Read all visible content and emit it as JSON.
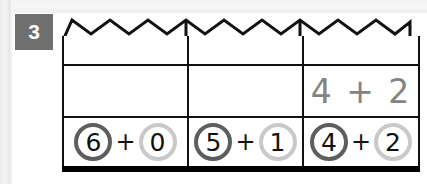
{
  "page": {
    "task_number": "3",
    "background_color": "#ffffff",
    "badge_color": "#6f6f6f"
  },
  "colors": {
    "grid_line": "#111111",
    "bottom_rule": "#000000",
    "circle_dark": "#5e5e5e",
    "circle_light": "#c9c9c9",
    "handwriting": "#838383"
  },
  "worksheet": {
    "torn_edge_icon": "zigzag-torn-edge",
    "columns": [
      {
        "id": "column-1",
        "work_row_answer": "",
        "given": {
          "left_operand": "6",
          "operator": "+",
          "right_operand": "0",
          "left_circle_style": "dark",
          "right_circle_style": "light"
        }
      },
      {
        "id": "column-2",
        "work_row_answer": "",
        "given": {
          "left_operand": "5",
          "operator": "+",
          "right_operand": "1",
          "left_circle_style": "dark",
          "right_circle_style": "light"
        }
      },
      {
        "id": "column-3",
        "work_row_answer": "4 + 2",
        "given": {
          "left_operand": "4",
          "operator": "+",
          "right_operand": "2",
          "left_circle_style": "dark",
          "right_circle_style": "light"
        }
      }
    ]
  }
}
